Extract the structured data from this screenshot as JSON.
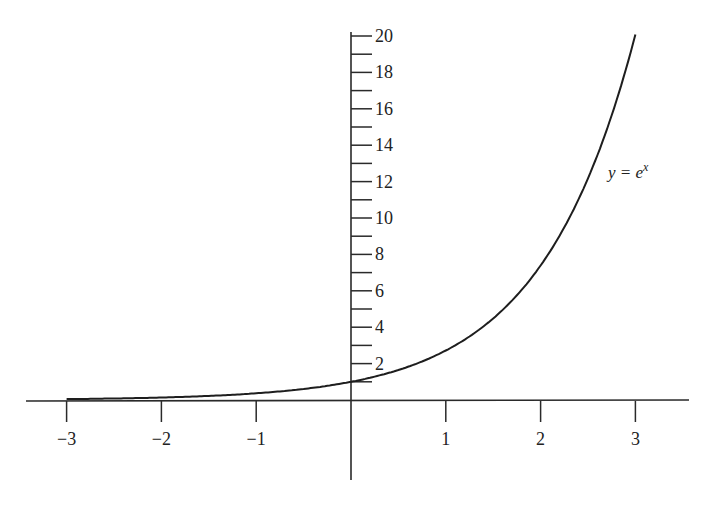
{
  "chart_data": {
    "type": "line",
    "title": "",
    "xlabel": "",
    "ylabel": "",
    "function": "e^x",
    "xlim": [
      -3,
      3
    ],
    "ylim": [
      0,
      20
    ],
    "grid": false,
    "legend": "none",
    "x_ticks": [
      -3,
      -2,
      -1,
      1,
      2,
      3
    ],
    "x_tick_labels": [
      "−3",
      "−2",
      "−1",
      "1",
      "2",
      "3"
    ],
    "y_ticks_major": [
      2,
      4,
      6,
      8,
      10,
      12,
      14,
      16,
      18,
      20
    ],
    "y_tick_labels": [
      "2",
      "4",
      "6",
      "8",
      "10",
      "12",
      "14",
      "16",
      "18",
      "20"
    ],
    "y_ticks_minor": [
      1,
      3,
      5,
      7,
      9,
      11,
      13,
      15,
      17,
      19
    ],
    "series": [
      {
        "name": "y = e^x",
        "x": [
          -3,
          -2.5,
          -2,
          -1.5,
          -1,
          -0.5,
          0,
          0.5,
          1,
          1.5,
          2,
          2.5,
          3
        ],
        "values": [
          0.05,
          0.08,
          0.14,
          0.22,
          0.37,
          0.61,
          1.0,
          1.65,
          2.72,
          4.48,
          7.39,
          12.18,
          20.09
        ]
      }
    ],
    "annotations": [
      {
        "text_parts": {
          "lhs": "y = e",
          "sup": "x"
        },
        "near_x": 2.7,
        "near_y": 12.2
      }
    ]
  },
  "labels": {
    "curve_label_main": "y = e",
    "curve_label_sup": "x"
  }
}
